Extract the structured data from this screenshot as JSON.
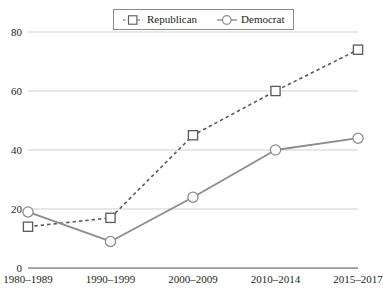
{
  "chart_data": {
    "type": "line",
    "title": "",
    "subtitle": "",
    "xlabel": "",
    "ylabel": "",
    "categories": [
      "1980–1989",
      "1990–1999",
      "2000–2009",
      "2010–2014",
      "2015–2017"
    ],
    "series": [
      {
        "name": "Republican",
        "values": [
          14,
          17,
          45,
          60,
          74
        ],
        "line_style": "dashed",
        "marker": "square-open",
        "color": "#5a5a5a"
      },
      {
        "name": "Democrat",
        "values": [
          19,
          9,
          24,
          40,
          44
        ],
        "line_style": "solid",
        "marker": "circle-open",
        "color": "#8c8c8c"
      }
    ],
    "ylim": [
      0,
      80
    ],
    "yticks": [
      0,
      20,
      40,
      60,
      80
    ],
    "ytick_labels": [
      "0",
      "20",
      "40",
      "60",
      "80"
    ],
    "grid": true,
    "grid_axis": "y",
    "grid_color": "#c9c9c9",
    "legend_position": "top-center",
    "legend_entries": [
      "Republican",
      "Democrat"
    ]
  },
  "legend": {
    "republican_label": "Republican",
    "democrat_label": "Democrat"
  },
  "axes": {
    "y_labels": [
      "80",
      "60",
      "40",
      "20",
      "0"
    ],
    "x_labels": [
      "1980–1989",
      "1990–1999",
      "2000–2009",
      "2010–2014",
      "2015–2017"
    ]
  }
}
